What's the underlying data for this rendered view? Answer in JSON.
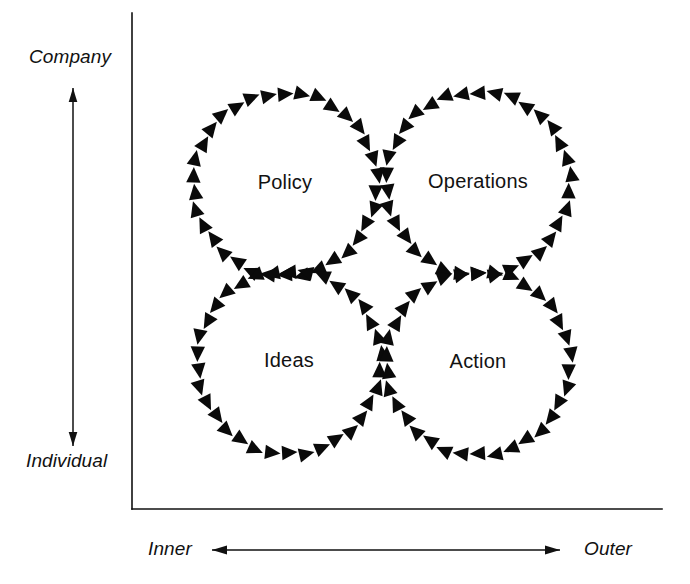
{
  "figure": {
    "background_color": "#ffffff",
    "ink_color": "#111111",
    "arrow_color": "#0a0a0a",
    "width": 690,
    "height": 584
  },
  "axes": {
    "vertical": {
      "label_top": "Company",
      "label_bottom": "Individual",
      "line": {
        "x": 132,
        "y1": 13,
        "y2": 509
      },
      "arrow": {
        "x": 73,
        "y_top": 88,
        "y_bottom": 446,
        "double_headed": true
      }
    },
    "horizontal": {
      "label_left": "Inner",
      "label_right": "Outer",
      "line": {
        "y": 509,
        "x1": 132,
        "x2": 662
      },
      "arrow": {
        "y": 550,
        "x_left": 212,
        "x_right": 560,
        "double_headed": true
      }
    }
  },
  "circles": [
    {
      "label": "Policy",
      "cx": 285,
      "cy": 184,
      "radius": 92,
      "arrow_count": 34,
      "direction": "clockwise",
      "quadrant": "company-inner"
    },
    {
      "label": "Operations",
      "cx": 478,
      "cy": 183,
      "radius": 92,
      "arrow_count": 34,
      "direction": "counter-clockwise",
      "quadrant": "company-outer"
    },
    {
      "label": "Ideas",
      "cx": 289,
      "cy": 362,
      "radius": 92,
      "arrow_count": 34,
      "direction": "counter-clockwise",
      "quadrant": "individual-inner"
    },
    {
      "label": "Action",
      "cx": 478,
      "cy": 363,
      "radius": 92,
      "arrow_count": 34,
      "direction": "clockwise",
      "quadrant": "individual-outer"
    }
  ]
}
